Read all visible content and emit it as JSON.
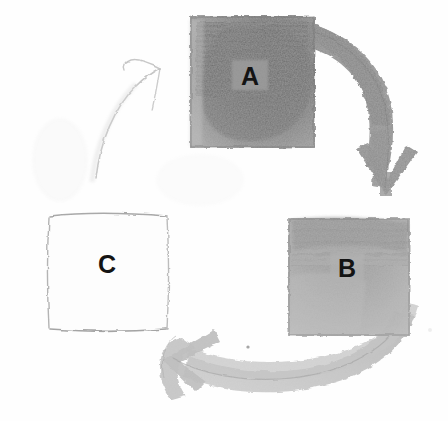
{
  "diagram": {
    "medium": "pencil-sketch",
    "background_color": "#fefefe",
    "canvas": {
      "width": 448,
      "height": 421
    },
    "nodes": [
      {
        "id": "node-a",
        "label": "A",
        "shape": "square",
        "fill_shade": "dark-gray",
        "fill_color": "#7d7d7d",
        "outline_color": "#8a8a8a",
        "label_patch_color": "#9a9a9a",
        "x": 190,
        "y": 16,
        "width": 125,
        "height": 132
      },
      {
        "id": "node-b",
        "label": "B",
        "shape": "square",
        "fill_shade": "medium-gray",
        "fill_color": "#a6a6a6",
        "outline_color": "#8f8f8f",
        "label_patch_color": "#b4b4b4",
        "x": 288,
        "y": 218,
        "width": 122,
        "height": 118
      },
      {
        "id": "node-c",
        "label": "C",
        "shape": "square",
        "fill_shade": "unshaded-white",
        "fill_color": "#fdfdfd",
        "outline_color": "#b9b9b9",
        "label_patch_color": "#fdfdfd",
        "x": 48,
        "y": 214,
        "width": 120,
        "height": 116
      }
    ],
    "arrows": [
      {
        "id": "arrow-a-to-b",
        "from": "A",
        "to": "B",
        "direction": "clockwise",
        "weight": "thick",
        "shade": "dark-gray",
        "color": "#8c8c8c",
        "arrowhead": "v-shape-down",
        "arrowhead_x": 386,
        "arrowhead_y": 190
      },
      {
        "id": "arrow-b-to-c",
        "from": "B",
        "to": "C",
        "direction": "clockwise",
        "weight": "medium",
        "shade": "light-gray",
        "color": "#bfbfbf",
        "arrowhead": "v-shape-left",
        "arrowhead_x": 172,
        "arrowhead_y": 352
      },
      {
        "id": "arrow-c-to-a",
        "from": "C",
        "to": "A",
        "direction": "clockwise",
        "weight": "thin-faint",
        "shade": "very-light-gray",
        "color": "#c9c9c9",
        "arrowhead": "v-shape-up-right",
        "arrowhead_x": 158,
        "arrowhead_y": 70
      }
    ]
  }
}
